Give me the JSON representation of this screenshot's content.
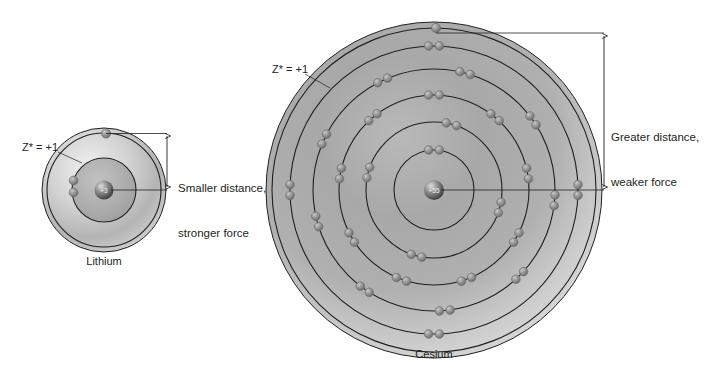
{
  "figure": {
    "type": "atomic-shell-diagram",
    "background_color": "#ffffff",
    "line_color": "#231f20",
    "electron_color": "#8a8a8a",
    "cloud_light": "#e8e8e8",
    "cloud_dark": "#9a9a9a"
  },
  "atoms": [
    {
      "id": "lithium",
      "name": "Lithium",
      "nucleus_charge": "+3",
      "effective_charge_label": "Z* = +1",
      "center": {
        "x": 104,
        "y": 190
      },
      "cloud_radius": 62,
      "shells": [
        {
          "index": 1,
          "radius": 32,
          "electron_count": 2
        },
        {
          "index": 2,
          "radius": 57,
          "electron_count": 1
        }
      ],
      "electron_configuration": [
        2,
        1
      ],
      "annotation": "Smaller distance,\nstronger force",
      "dimension": {
        "top_y": 133,
        "bottom_y": 190,
        "x": 167,
        "length_px": 57
      }
    },
    {
      "id": "cesium",
      "name": "Cesium",
      "nucleus_charge": "+55",
      "effective_charge_label": "Z* = +1",
      "center": {
        "x": 434,
        "y": 190
      },
      "cloud_radius": 168,
      "shells": [
        {
          "index": 1,
          "radius": 40,
          "electron_count": 2
        },
        {
          "index": 2,
          "radius": 68,
          "electron_count": 8
        },
        {
          "index": 3,
          "radius": 95,
          "electron_count": 18
        },
        {
          "index": 4,
          "radius": 121,
          "electron_count": 18
        },
        {
          "index": 5,
          "radius": 144,
          "electron_count": 8
        },
        {
          "index": 6,
          "radius": 162,
          "electron_count": 1
        }
      ],
      "electron_configuration": [
        2,
        8,
        18,
        18,
        8,
        1
      ],
      "annotation": "Greater distance,\nweaker force",
      "dimension": {
        "top_y": 33,
        "bottom_y": 190,
        "x": 604,
        "length_px": 157
      }
    }
  ],
  "annotations": {
    "lithium_note_line1": "Smaller distance,",
    "lithium_note_line2": "stronger force",
    "cesium_note_line1": "Greater distance,",
    "cesium_note_line2": "weaker force"
  }
}
